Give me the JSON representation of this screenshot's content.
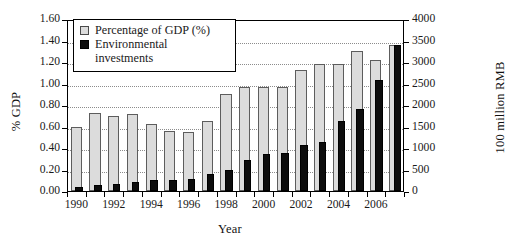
{
  "chart_data": {
    "type": "bar",
    "title": "",
    "xlabel": "Year",
    "ylabel": "% GDP",
    "y2label": "100 million RMB",
    "grid": true,
    "legend_position": "top-left",
    "ylim": [
      0.0,
      1.6
    ],
    "y2lim": [
      0,
      4000
    ],
    "yticks": [
      "0.00",
      "0.20",
      "0.40",
      "0.60",
      "0.80",
      "1.00",
      "1.20",
      "1.40",
      "1.60"
    ],
    "y2ticks": [
      "0",
      "500",
      "1000",
      "1500",
      "2000",
      "2500",
      "3000",
      "3500",
      "4000"
    ],
    "categories": [
      1990,
      1991,
      1992,
      1993,
      1994,
      1995,
      1996,
      1997,
      1998,
      1999,
      2000,
      2001,
      2002,
      2003,
      2004,
      2005,
      2006,
      2007
    ],
    "xtick_labels": [
      "1990",
      "1992",
      "1994",
      "1996",
      "1998",
      "2000",
      "2002",
      "2004",
      "2006"
    ],
    "series": [
      {
        "name": "Percentage of GDP (%)",
        "axis": "left",
        "color": "#dcdcdc",
        "values": [
          0.6,
          0.73,
          0.7,
          0.72,
          0.62,
          0.56,
          0.55,
          0.65,
          0.9,
          0.97,
          0.97,
          0.97,
          1.13,
          1.18,
          1.18,
          1.3,
          1.22,
          1.36
        ]
      },
      {
        "name": "Environmental investments",
        "axis": "right",
        "color": "#0d0d0d",
        "values": [
          100,
          150,
          170,
          210,
          250,
          260,
          290,
          390,
          500,
          720,
          850,
          880,
          1070,
          1130,
          1630,
          1910,
          2590,
          3390
        ]
      }
    ]
  },
  "legend": {
    "items": [
      {
        "label": "Percentage of GDP (%)",
        "swatch": "gdp"
      },
      {
        "label": "Environmental",
        "label2": "investments",
        "swatch": "env"
      }
    ]
  }
}
